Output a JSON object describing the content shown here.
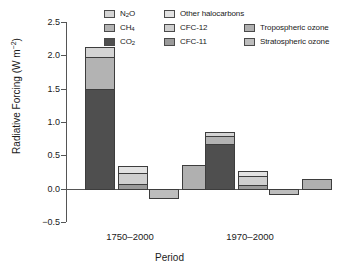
{
  "chart_data": {
    "type": "bar",
    "title": "",
    "subtitle": "",
    "xlabel": "Period",
    "ylabel": "Radiative Forcing (W m⁻²)",
    "ylabel_text": "Radiative Forcing (W m",
    "ylabel_sup": "−2",
    "ylabel_tail": ")",
    "ylim": [
      -0.5,
      2.5
    ],
    "ytick_values": [
      2.5,
      2.0,
      1.5,
      1.0,
      0.5,
      0.0,
      -0.5
    ],
    "ytick_labels": [
      "2.5",
      "2.0",
      "1.5",
      "1.0",
      "0.5",
      "0.0",
      "−0.5"
    ],
    "grid": false,
    "legend_position": "top",
    "categories": [
      "1750–2000",
      "1970–2000"
    ],
    "stacking": "stacked-groups",
    "bar_groups": [
      {
        "category": "1750–2000",
        "bars": [
          {
            "name": "greenhouse-gases",
            "total": 2.13,
            "segments": [
              {
                "series": "CO2",
                "value": 1.5
              },
              {
                "series": "CH4",
                "value": 0.48
              },
              {
                "series": "N2O",
                "value": 0.15
              }
            ]
          },
          {
            "name": "halocarbons",
            "total": 0.34,
            "segments": [
              {
                "series": "CFC-11",
                "value": 0.07
              },
              {
                "series": "CFC-12",
                "value": 0.17
              },
              {
                "series": "Other halocarbons",
                "value": 0.1
              }
            ]
          },
          {
            "name": "stratospheric-ozone",
            "total": -0.15,
            "segments": [
              {
                "series": "Stratospheric ozone",
                "value": -0.15
              }
            ]
          },
          {
            "name": "tropospheric-ozone",
            "total": 0.35,
            "segments": [
              {
                "series": "Tropospheric ozone",
                "value": 0.35
              }
            ]
          }
        ]
      },
      {
        "category": "1970–2000",
        "bars": [
          {
            "name": "greenhouse-gases",
            "total": 0.85,
            "segments": [
              {
                "series": "CO2",
                "value": 0.67
              },
              {
                "series": "CH4",
                "value": 0.12
              },
              {
                "series": "N2O",
                "value": 0.06
              }
            ]
          },
          {
            "name": "halocarbons",
            "total": 0.27,
            "segments": [
              {
                "series": "CFC-11",
                "value": 0.06
              },
              {
                "series": "CFC-12",
                "value": 0.13
              },
              {
                "series": "Other halocarbons",
                "value": 0.08
              }
            ]
          },
          {
            "name": "stratospheric-ozone",
            "total": -0.1,
            "segments": [
              {
                "series": "Stratospheric ozone",
                "value": -0.1
              }
            ]
          },
          {
            "name": "tropospheric-ozone",
            "total": 0.15,
            "segments": [
              {
                "series": "Tropospheric ozone",
                "value": 0.15
              }
            ]
          }
        ]
      }
    ],
    "series_colors": {
      "N2O": "#d4d4d4",
      "CH4": "#b3b3b3",
      "CO2": "#4f4f4f",
      "Other halocarbons": "#e2e2e2",
      "CFC-12": "#cfcfcf",
      "CFC-11": "#9a9a9a",
      "Tropospheric ozone": "#b0b0b0",
      "Stratospheric ozone": "#bdbdbd"
    }
  },
  "legend": {
    "column1": [
      {
        "label": "N",
        "sub": "2",
        "tail": "O",
        "key": "N2O"
      },
      {
        "label": "CH",
        "sub": "4",
        "tail": "",
        "key": "CH4"
      },
      {
        "label": "CO",
        "sub": "2",
        "tail": "",
        "key": "CO2"
      }
    ],
    "column2": [
      {
        "label": "Other halocarbons",
        "key": "Other halocarbons"
      },
      {
        "label": "CFC-12",
        "key": "CFC-12"
      },
      {
        "label": "CFC-11",
        "key": "CFC-11"
      }
    ],
    "column3": [
      {
        "label": "Tropospheric ozone",
        "key": "Tropospheric ozone"
      },
      {
        "label": "Stratospheric ozone",
        "key": "Stratospheric ozone"
      }
    ]
  },
  "axes": {
    "x_title": "Period",
    "x_tick_labels": [
      "1750–2000",
      "1970–2000"
    ],
    "y_tick_labels": [
      "2.5",
      "2.0",
      "1.5",
      "1.0",
      "0.5",
      "0.0",
      "−0.5"
    ],
    "y_title_main": "Radiative Forcing (W m",
    "y_title_sup": "−2",
    "y_title_end": ")"
  }
}
